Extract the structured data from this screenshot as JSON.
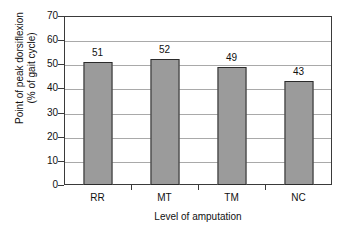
{
  "chart_data": {
    "type": "bar",
    "title": "",
    "categories": [
      "RR",
      "MT",
      "TM",
      "NC"
    ],
    "values": [
      51,
      52,
      49,
      43
    ],
    "data_labels": [
      "51",
      "52",
      "49",
      "43"
    ],
    "xlabel": "Level of amputation",
    "ylabel_line1": "Point of peak dorsiflexion",
    "ylabel_line2": "(% of gait cycle)",
    "ylim": [
      0,
      70
    ],
    "ytick_values": [
      0,
      10,
      20,
      30,
      40,
      50,
      60,
      70
    ],
    "ytick_labels": [
      "0",
      "10",
      "20",
      "30",
      "40",
      "50",
      "60",
      "70"
    ],
    "grid": "horizontal",
    "legend": "none",
    "bar_color": "#9b9b9b",
    "bar_edge_color": "#2b2b2b",
    "axis_color": "#3a3a3a",
    "gridline_color": "#a9a9a9",
    "background_color": "#ffffff"
  }
}
